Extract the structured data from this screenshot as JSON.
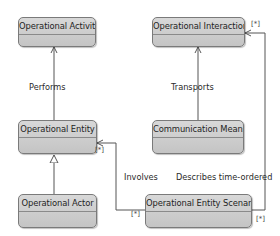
{
  "diagram": {
    "classes": [
      {
        "id": "operational-activity",
        "label": "Operational Activity"
      },
      {
        "id": "operational-interaction",
        "label": "Operational Interaction"
      },
      {
        "id": "operational-entity",
        "label": "Operational Entity"
      },
      {
        "id": "communication-means",
        "label": "Communication Means"
      },
      {
        "id": "operational-actor",
        "label": "Operational Actor"
      },
      {
        "id": "operational-entity-scenario",
        "label": "Operational Entity Scenario"
      }
    ],
    "relations": [
      {
        "from": "operational-entity",
        "to": "operational-activity",
        "label": "Performs",
        "type": "association"
      },
      {
        "from": "communication-means",
        "to": "operational-interaction",
        "label": "Transports",
        "type": "association"
      },
      {
        "from": "operational-actor",
        "to": "operational-entity",
        "label": "",
        "type": "generalization"
      },
      {
        "from": "operational-entity-scenario",
        "to": "operational-entity",
        "label": "Involves",
        "type": "association",
        "source_multiplicity": "[*]",
        "target_multiplicity": "[*]"
      },
      {
        "from": "operational-entity-scenario",
        "to": "operational-interaction",
        "label": "Describes time-ordered",
        "type": "association",
        "source_multiplicity": "[*]",
        "target_multiplicity": "[*]"
      }
    ],
    "multiplicity": "[*]",
    "colors": {
      "box_fill": "#cfcfcf",
      "box_border": "#7a7a7a",
      "line": "#555555",
      "background": "#ffffff"
    }
  }
}
